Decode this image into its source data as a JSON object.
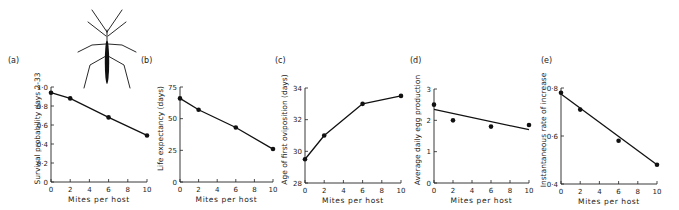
{
  "figure": {
    "illustration": "water-strider-insect"
  },
  "chart_data": [
    {
      "type": "line",
      "panel_label": "(a)",
      "title": "",
      "xlabel": "Mites per host",
      "ylabel": "Survival probability days 2-33",
      "x": [
        0,
        2,
        6,
        10
      ],
      "values": [
        0.94,
        0.88,
        0.68,
        0.49
      ],
      "xlim": [
        0,
        10
      ],
      "ylim": [
        0,
        1.0
      ],
      "xticks": [
        "0",
        "2",
        "4",
        "6",
        "8",
        "10"
      ],
      "yticks": [
        "0",
        "0·2",
        "0·4",
        "0·6",
        "0·8",
        "1·0"
      ],
      "fit": "straight line through points",
      "grid": false
    },
    {
      "type": "line",
      "panel_label": "(b)",
      "title": "",
      "xlabel": "Mites per host",
      "ylabel": "Life expectancy (days)",
      "x": [
        0,
        2,
        6,
        10
      ],
      "values": [
        66,
        57,
        43,
        26
      ],
      "xlim": [
        0,
        10
      ],
      "ylim": [
        0,
        75
      ],
      "xticks": [
        "0",
        "2",
        "4",
        "6",
        "8",
        "10"
      ],
      "yticks": [
        "0",
        "25",
        "50",
        "75"
      ],
      "fit": "straight line through points",
      "grid": false
    },
    {
      "type": "line",
      "panel_label": "(c)",
      "title": "",
      "xlabel": "Mites per host",
      "ylabel": "Age of first oviposition (days)",
      "x": [
        0,
        2,
        6,
        10
      ],
      "values": [
        29.5,
        31.0,
        33.0,
        33.5
      ],
      "xlim": [
        0,
        10
      ],
      "ylim": [
        28,
        34
      ],
      "xticks": [
        "0",
        "2",
        "4",
        "6",
        "8",
        "10"
      ],
      "yticks": [
        "28",
        "30",
        "32",
        "34"
      ],
      "fit": "curve through points",
      "grid": false
    },
    {
      "type": "scatter",
      "panel_label": "(d)",
      "title": "",
      "xlabel": "Mites per host",
      "ylabel": "Average daily egg production",
      "x": [
        0,
        2,
        6,
        10
      ],
      "values": [
        2.5,
        2.0,
        1.8,
        1.85
      ],
      "regression_line": {
        "x": [
          0,
          10
        ],
        "y": [
          2.35,
          1.7
        ]
      },
      "xlim": [
        0,
        10
      ],
      "ylim": [
        0,
        3
      ],
      "xticks": [
        "0",
        "2",
        "4",
        "6",
        "8",
        "10"
      ],
      "yticks": [
        "0",
        "1",
        "2",
        "3"
      ],
      "grid": false
    },
    {
      "type": "scatter",
      "panel_label": "(e)",
      "title": "",
      "xlabel": "Mites per host",
      "ylabel": "Instantaneous rate of increase",
      "x": [
        0,
        2,
        6,
        10
      ],
      "values": [
        0.78,
        0.71,
        0.58,
        0.48
      ],
      "regression_line": {
        "x": [
          0,
          10
        ],
        "y": [
          0.775,
          0.48
        ]
      },
      "xlim": [
        0,
        10
      ],
      "ylim": [
        0.4,
        0.8
      ],
      "xticks": [
        "0",
        "2",
        "4",
        "6",
        "8",
        "10"
      ],
      "yticks": [
        "0·4",
        "0·6",
        "0·8"
      ],
      "grid": false
    }
  ]
}
